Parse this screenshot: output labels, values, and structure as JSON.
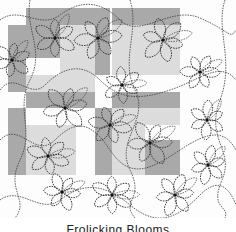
{
  "image": {
    "subject": "quilting pattern sample with stitched floral motifs over gray patchwork blocks",
    "caption": "Frolicking Blooms"
  },
  "colors": {
    "background": "#fdfdfd",
    "dark_block": "#a9a9a9",
    "mid_block": "#bdbdbd",
    "light_block": "#dcdcdc",
    "stitch": "#3a3a3a"
  },
  "blocks": [
    {
      "x": 26,
      "y": 8,
      "w": 84,
      "h": 17,
      "shade": "dark"
    },
    {
      "x": 112,
      "y": 8,
      "w": 68,
      "h": 17,
      "shade": "dark"
    },
    {
      "x": 8,
      "y": 25,
      "w": 52,
      "h": 33,
      "shade": "dark"
    },
    {
      "x": 60,
      "y": 25,
      "w": 35,
      "h": 50,
      "shade": "light"
    },
    {
      "x": 95,
      "y": 25,
      "w": 15,
      "h": 50,
      "shade": "dark"
    },
    {
      "x": 112,
      "y": 25,
      "w": 68,
      "h": 50,
      "shade": "light"
    },
    {
      "x": 8,
      "y": 58,
      "w": 18,
      "h": 34,
      "shade": "dark"
    },
    {
      "x": 26,
      "y": 75,
      "w": 69,
      "h": 17,
      "shade": "light"
    },
    {
      "x": 26,
      "y": 92,
      "w": 69,
      "h": 16,
      "shade": "dark"
    },
    {
      "x": 112,
      "y": 92,
      "w": 68,
      "h": 16,
      "shade": "dark"
    },
    {
      "x": 8,
      "y": 108,
      "w": 18,
      "h": 67,
      "shade": "dark"
    },
    {
      "x": 95,
      "y": 108,
      "w": 17,
      "h": 67,
      "shade": "dark"
    },
    {
      "x": 112,
      "y": 108,
      "w": 68,
      "h": 17,
      "shade": "light"
    },
    {
      "x": 26,
      "y": 125,
      "w": 50,
      "h": 50,
      "shade": "light"
    },
    {
      "x": 112,
      "y": 125,
      "w": 33,
      "h": 50,
      "shade": "light"
    },
    {
      "x": 145,
      "y": 140,
      "w": 35,
      "h": 35,
      "shade": "dark"
    }
  ],
  "flowers": [
    {
      "cx": 55,
      "cy": 38,
      "r": 22
    },
    {
      "cx": 98,
      "cy": 38,
      "r": 24
    },
    {
      "cx": 163,
      "cy": 40,
      "r": 24
    },
    {
      "cx": 12,
      "cy": 60,
      "r": 20
    },
    {
      "cx": 200,
      "cy": 72,
      "r": 20
    },
    {
      "cx": 122,
      "cy": 85,
      "r": 20
    },
    {
      "cx": 65,
      "cy": 108,
      "r": 24
    },
    {
      "cx": 110,
      "cy": 125,
      "r": 22
    },
    {
      "cx": 207,
      "cy": 120,
      "r": 20
    },
    {
      "cx": 150,
      "cy": 143,
      "r": 24
    },
    {
      "cx": 48,
      "cy": 156,
      "r": 22
    },
    {
      "cx": 208,
      "cy": 165,
      "r": 20
    },
    {
      "cx": 62,
      "cy": 192,
      "r": 20
    },
    {
      "cx": 112,
      "cy": 195,
      "r": 22
    },
    {
      "cx": 175,
      "cy": 195,
      "r": 22
    }
  ]
}
